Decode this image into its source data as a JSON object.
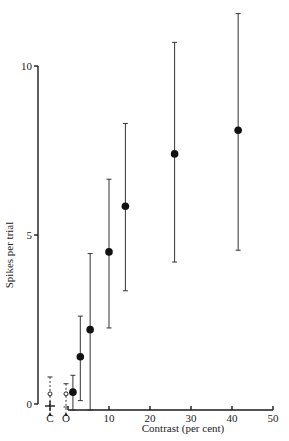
{
  "chart_data": {
    "type": "scatter",
    "title": "",
    "xlabel": "Contrast (per cent)",
    "ylabel": "Spikes per trial",
    "xlim": [
      0,
      50
    ],
    "ylim": [
      0,
      10
    ],
    "xticks": [
      10,
      20,
      30,
      40,
      50
    ],
    "yticks": [
      0,
      5,
      10
    ],
    "grid": false,
    "legend": null,
    "series": [
      {
        "name": "responses",
        "marker": "filled-circle",
        "points": [
          {
            "x": 1.2,
            "y": 0.35,
            "yerr_low": 0.0,
            "yerr_high": 0.85
          },
          {
            "x": 3.0,
            "y": 1.4,
            "yerr_low": 0.1,
            "yerr_high": 2.6
          },
          {
            "x": 5.4,
            "y": 2.2,
            "yerr_low": 0.0,
            "yerr_high": 4.45
          },
          {
            "x": 10.0,
            "y": 4.5,
            "yerr_low": 2.25,
            "yerr_high": 6.65
          },
          {
            "x": 14.0,
            "y": 5.85,
            "yerr_low": 3.35,
            "yerr_high": 8.3
          },
          {
            "x": 26.0,
            "y": 7.4,
            "yerr_low": 4.2,
            "yerr_high": 10.7
          },
          {
            "x": 41.5,
            "y": 8.1,
            "yerr_low": 4.55,
            "yerr_high": 11.55
          }
        ]
      },
      {
        "name": "controls",
        "marker": "open-circle",
        "points": [
          {
            "label": "C",
            "y": 0.3,
            "yerr_high": 0.8
          },
          {
            "label": "O",
            "y": 0.3,
            "yerr_high": 0.6
          }
        ]
      }
    ],
    "annotations": [
      "C",
      "O"
    ]
  },
  "labels": {
    "xlabel": "Contrast (per cent)",
    "ylabel": "Spikes per trial",
    "x_ticks": [
      "10",
      "20",
      "30",
      "40",
      "50"
    ],
    "y_ticks": [
      "0",
      "5",
      "10"
    ],
    "control_c": "C",
    "control_o": "O"
  }
}
